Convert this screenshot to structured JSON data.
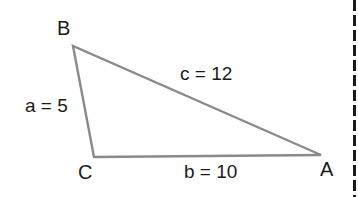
{
  "diagram": {
    "type": "triangle",
    "vertices": [
      {
        "name": "B",
        "x": 73,
        "y": 46
      },
      {
        "name": "C",
        "x": 94,
        "y": 157
      },
      {
        "name": "A",
        "x": 321,
        "y": 155
      }
    ],
    "sides": [
      {
        "label": "a = 5",
        "between": [
          "B",
          "C"
        ]
      },
      {
        "label": "b = 10",
        "between": [
          "C",
          "A"
        ]
      },
      {
        "label": "c = 12",
        "between": [
          "B",
          "A"
        ]
      }
    ],
    "colors": {
      "edge": "#8a8a8a",
      "text": "#1a1a1a",
      "dash": "#1a1a1a"
    }
  },
  "labels": {
    "vertex_b": "B",
    "vertex_c": "C",
    "vertex_a": "A",
    "side_a": "a = 5",
    "side_b": "b = 10",
    "side_c": "c = 12"
  }
}
